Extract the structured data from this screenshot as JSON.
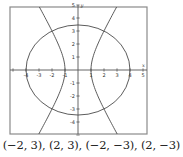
{
  "chart_data": {
    "type": "line",
    "title": "",
    "xlabel": "x",
    "ylabel": "y",
    "xlim": [
      -5,
      5
    ],
    "ylim": [
      -5,
      5
    ],
    "grid": false,
    "x_ticks": [
      -4,
      -3,
      -2,
      -1,
      1,
      2,
      3,
      4,
      5
    ],
    "y_ticks": [
      5,
      4,
      3,
      2,
      1,
      -1,
      -2,
      -3,
      -4
    ],
    "series": [
      {
        "name": "ellipse",
        "equation": "x^2/16 + y^2/12 = 1",
        "semi_axis_x": 4,
        "semi_axis_y": 3.464
      },
      {
        "name": "hyperbola",
        "equation": "x^2 - y^2/3 = 1",
        "vertices": [
          [
            -1,
            0
          ],
          [
            1,
            0
          ]
        ]
      }
    ],
    "intersection_points": [
      [
        -2,
        3
      ],
      [
        2,
        3
      ],
      [
        -2,
        -3
      ],
      [
        2,
        -3
      ]
    ]
  },
  "caption": {
    "text": "(−2, 3), (2, 3), (−2, −3), (2, −3)"
  },
  "tick_labels": {
    "x": [
      "-4",
      "-3",
      "-2",
      "-1",
      "1",
      "2",
      "3",
      "4",
      "5"
    ],
    "y": [
      "5",
      "4",
      "3",
      "2",
      "1",
      "-1",
      "-2",
      "-3",
      "-4"
    ]
  }
}
